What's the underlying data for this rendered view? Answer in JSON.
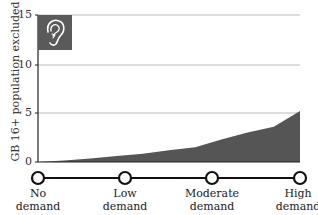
{
  "chart_data": {
    "type": "area",
    "title": "",
    "ylabel": "GB 16+ population excluded (%)",
    "xlabel": "",
    "ylim": [
      0,
      15
    ],
    "yticks": [
      0,
      5,
      10,
      15
    ],
    "grid": true,
    "icon": "ear-icon",
    "x_stages": [
      "No demand",
      "Low demand",
      "Moderate demand",
      "High demand"
    ],
    "x": [
      0,
      0.1,
      0.2,
      0.3,
      0.4,
      0.5,
      0.6,
      0.7,
      0.8,
      0.9,
      1.0
    ],
    "values": [
      0.0,
      0.15,
      0.35,
      0.6,
      0.85,
      1.2,
      1.5,
      2.3,
      3.0,
      3.6,
      5.2
    ],
    "fill_color": "#555555",
    "legend": null
  },
  "axis": {
    "ylabel": "GB 16+ population excluded (%)",
    "ticks": [
      "0",
      "5",
      "10",
      "15"
    ]
  },
  "stages": [
    {
      "line1": "No",
      "line2": "demand"
    },
    {
      "line1": "Low",
      "line2": "demand"
    },
    {
      "line1": "Moderate",
      "line2": "demand"
    },
    {
      "line1": "High",
      "line2": "demand"
    }
  ],
  "colors": {
    "area": "#555555",
    "icon_bg": "#5a5a5a",
    "grid": "#bbbbbb",
    "axis": "#222222"
  }
}
